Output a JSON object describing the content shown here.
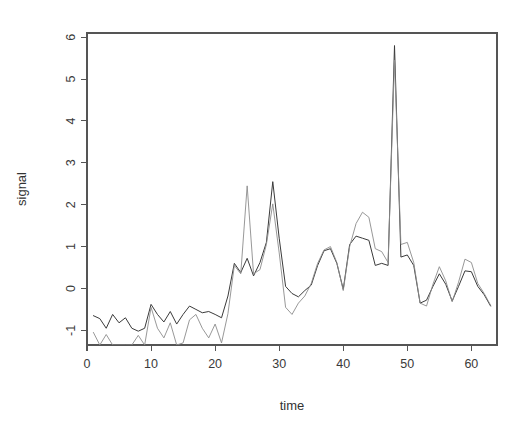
{
  "chart_data": {
    "type": "line",
    "title": "",
    "xlabel": "time",
    "ylabel": "signal",
    "xlim": [
      0,
      64
    ],
    "ylim": [
      -1.35,
      6.1
    ],
    "xticks": [
      0,
      10,
      20,
      30,
      40,
      50,
      60
    ],
    "yticks": [
      -1,
      0,
      1,
      2,
      3,
      4,
      5,
      6
    ],
    "xtick_labels": [
      "0",
      "10",
      "20",
      "30",
      "40",
      "50",
      "60"
    ],
    "ytick_labels": [
      "-1",
      "0",
      "1",
      "2",
      "3",
      "4",
      "5",
      "6"
    ],
    "grid": false,
    "legend": "none",
    "background": "#ffffff",
    "axis_color": "#555555",
    "x": [
      1,
      2,
      3,
      4,
      5,
      6,
      7,
      8,
      9,
      10,
      11,
      12,
      13,
      14,
      15,
      16,
      17,
      18,
      19,
      20,
      21,
      22,
      23,
      24,
      25,
      26,
      27,
      28,
      29,
      30,
      31,
      32,
      33,
      34,
      35,
      36,
      37,
      38,
      39,
      40,
      41,
      42,
      43,
      44,
      45,
      46,
      47,
      48,
      49,
      50,
      51,
      52,
      53,
      54,
      55,
      56,
      57,
      58,
      59,
      60,
      61,
      62,
      63
    ],
    "series": [
      {
        "name": "observed",
        "color": "#3a3a3a",
        "width": 1.0,
        "values": [
          -0.65,
          -0.72,
          -0.95,
          -0.62,
          -0.82,
          -0.7,
          -0.95,
          -1.02,
          -0.95,
          -0.38,
          -0.62,
          -0.8,
          -0.55,
          -0.85,
          -0.62,
          -0.42,
          -0.5,
          -0.58,
          -0.55,
          -0.62,
          -0.7,
          -0.18,
          0.6,
          0.38,
          0.72,
          0.3,
          0.62,
          1.1,
          2.55,
          1.2,
          0.05,
          -0.12,
          -0.2,
          -0.05,
          0.08,
          0.55,
          0.9,
          0.95,
          0.6,
          -0.02,
          1.05,
          1.25,
          1.2,
          1.15,
          0.55,
          0.6,
          0.55,
          5.8,
          0.75,
          0.8,
          0.55,
          -0.35,
          -0.28,
          0.05,
          0.35,
          0.1,
          -0.3,
          0.05,
          0.42,
          0.4,
          0.05,
          -0.15,
          -0.42
        ]
      },
      {
        "name": "fitted",
        "color": "#8c8c8c",
        "width": 0.9,
        "values": [
          -1.05,
          -1.35,
          -1.1,
          -1.35,
          -1.35,
          -1.35,
          -1.35,
          -1.12,
          -1.35,
          -0.45,
          -0.95,
          -1.18,
          -0.82,
          -1.35,
          -1.3,
          -0.75,
          -0.62,
          -0.95,
          -1.18,
          -0.85,
          -1.3,
          -0.6,
          0.55,
          0.35,
          2.45,
          0.35,
          0.45,
          1.05,
          2.02,
          0.85,
          -0.45,
          -0.62,
          -0.35,
          -0.18,
          0.12,
          0.6,
          0.92,
          1.0,
          0.62,
          -0.05,
          1.0,
          1.55,
          1.82,
          1.7,
          0.95,
          0.88,
          0.62,
          5.45,
          1.05,
          1.1,
          0.62,
          -0.35,
          -0.42,
          0.1,
          0.52,
          0.18,
          -0.32,
          0.15,
          0.7,
          0.62,
          0.12,
          -0.12,
          -0.4
        ]
      }
    ]
  }
}
